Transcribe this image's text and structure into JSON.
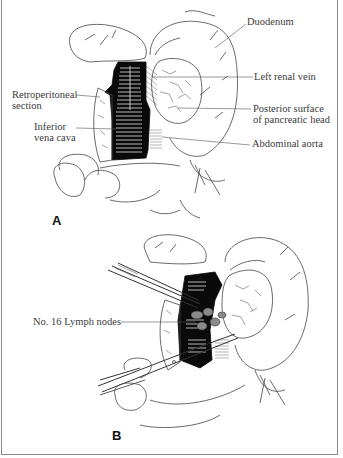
{
  "figure": {
    "panels": [
      {
        "id": "A",
        "label": "A",
        "annotations": {
          "duodenum": "Duodenum",
          "left_renal_vein": "Left renal vein",
          "posterior_surface_line1": "Posterior surface",
          "posterior_surface_line2": "of pancreatic head",
          "abdominal_aorta": "Abdominal aorta",
          "retroperitoneal_line1": "Retroperitoneal",
          "retroperitoneal_line2": "section",
          "ivc_line1": "Inferior",
          "ivc_line2": "vena cava"
        }
      },
      {
        "id": "B",
        "label": "B",
        "annotations": {
          "lymph_nodes": "No. 16 Lymph nodes"
        }
      }
    ]
  }
}
